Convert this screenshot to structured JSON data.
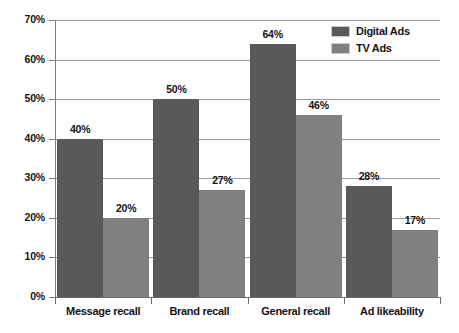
{
  "chart_data": {
    "type": "bar",
    "title": "",
    "subtitle": "",
    "xlabel": "",
    "ylabel": "",
    "categories": [
      "Message recall",
      "Brand recall",
      "General recall",
      "Ad likeability"
    ],
    "series": [
      {
        "name": "Digital Ads",
        "color": "#595959",
        "values": [
          40,
          50,
          64,
          28
        ]
      },
      {
        "name": "TV Ads",
        "color": "#808080",
        "values": [
          20,
          27,
          46,
          17
        ]
      }
    ],
    "value_labels": [
      [
        "40%",
        "50%",
        "64%",
        "28%"
      ],
      [
        "20%",
        "27%",
        "46%",
        "17%"
      ]
    ],
    "ylim": [
      0,
      70
    ],
    "ytick_values": [
      0,
      10,
      20,
      30,
      40,
      50,
      60,
      70
    ],
    "ytick_labels": [
      "0%",
      "10%",
      "20%",
      "30%",
      "40%",
      "50%",
      "60%",
      "70%"
    ],
    "grid": true,
    "legend_position": "top-right",
    "legend_entries": [
      "Digital Ads",
      "TV Ads"
    ],
    "background_color": "#ffffff",
    "axis_color": "#6a6a6a",
    "gridline_color": "#9a9a9a",
    "text_color": "#141414"
  }
}
